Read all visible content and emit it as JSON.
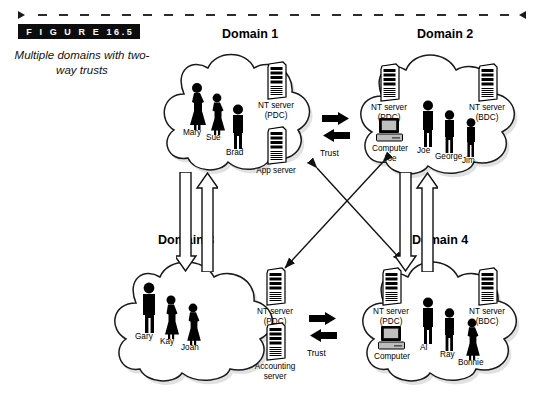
{
  "figure": {
    "banner_label": "F I G U R E   16.5",
    "caption": "Multiple domains with two-way trusts"
  },
  "domains": [
    {
      "id": "domain-1",
      "title": "Domain 1",
      "people": [
        {
          "name": "Mary",
          "gender": "female"
        },
        {
          "name": "Sue",
          "gender": "female"
        },
        {
          "name": "Brad",
          "gender": "male"
        }
      ],
      "devices": [
        {
          "type": "server-tower",
          "label": "NT server\n(PDC)",
          "label_line1": "NT server",
          "label_line2": "(PDC)"
        },
        {
          "type": "server-tower",
          "label": "App server",
          "label_line1": "App server",
          "label_line2": ""
        }
      ]
    },
    {
      "id": "domain-2",
      "title": "Domain 2",
      "people": [
        {
          "name": "Joe",
          "gender": "male"
        },
        {
          "name": "George",
          "gender": "male"
        },
        {
          "name": "Jim",
          "gender": "male"
        }
      ],
      "devices": [
        {
          "type": "server-tower",
          "label_line1": "NT server",
          "label_line2": "(PDC)"
        },
        {
          "type": "server-tower",
          "label_line1": "NT server",
          "label_line2": "(BDC)"
        },
        {
          "type": "desktop-computer",
          "label_line1": "Computer",
          "label_line2": "Joe"
        }
      ]
    },
    {
      "id": "domain-3",
      "title": "Domain 3",
      "people": [
        {
          "name": "Gary",
          "gender": "male"
        },
        {
          "name": "Kay",
          "gender": "female"
        },
        {
          "name": "Joan",
          "gender": "female"
        }
      ],
      "devices": [
        {
          "type": "server-tower",
          "label_line1": "NT server",
          "label_line2": "(PDC)"
        },
        {
          "type": "server-tower",
          "label_line1": "Accounting",
          "label_line2": "server"
        }
      ]
    },
    {
      "id": "domain-4",
      "title": "Domain 4",
      "people": [
        {
          "name": "Al",
          "gender": "male"
        },
        {
          "name": "Ray",
          "gender": "male"
        },
        {
          "name": "Bonnie",
          "gender": "female"
        }
      ],
      "devices": [
        {
          "type": "server-tower",
          "label_line1": "NT server",
          "label_line2": "(PDC)"
        },
        {
          "type": "server-tower",
          "label_line1": "NT server",
          "label_line2": "(BDC)"
        },
        {
          "type": "desktop-computer",
          "label_line1": "Computer",
          "label_line2": ""
        }
      ]
    }
  ],
  "trusts": [
    {
      "id": "trust-top",
      "label": "Trust",
      "style": "solid-block",
      "direction": "two-way",
      "between": [
        "Domain 1",
        "Domain 2"
      ]
    },
    {
      "id": "trust-bottom",
      "label": "Trust",
      "style": "solid-block",
      "direction": "two-way",
      "between": [
        "Domain 3",
        "Domain 4"
      ]
    },
    {
      "id": "trust-left",
      "label": "",
      "style": "hollow-block",
      "direction": "two-way",
      "between": [
        "Domain 1",
        "Domain 3"
      ]
    },
    {
      "id": "trust-right",
      "label": "",
      "style": "hollow-block",
      "direction": "two-way",
      "between": [
        "Domain 2",
        "Domain 4"
      ]
    },
    {
      "id": "trust-diagonal-1-4",
      "label": "",
      "style": "thin-line",
      "direction": "two-way",
      "between": [
        "Domain 1",
        "Domain 4"
      ]
    },
    {
      "id": "trust-diagonal-2-3",
      "label": "",
      "style": "thin-line",
      "direction": "two-way",
      "between": [
        "Domain 2",
        "Domain 3"
      ]
    }
  ],
  "colors": {
    "ink": "#000000",
    "banner_bg": "#0d0d0d",
    "banner_text": "#ffffff",
    "cloud_fill": "#ffffff",
    "cloud_stroke": "#1a1a1a",
    "shadow": "#bdbdbd"
  }
}
